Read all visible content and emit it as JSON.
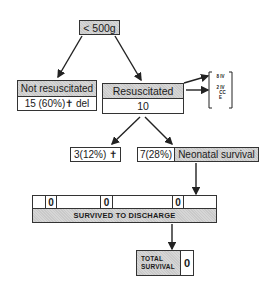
{
  "root": {
    "label": "< 500g"
  },
  "not_resuscitated": {
    "title": "Not resuscitated",
    "value": "15 (60%)✝ del"
  },
  "resuscitated": {
    "title": "Resuscitated",
    "value": "10",
    "methods": [
      "8 IV",
      "2 IV",
      "CC",
      "E"
    ]
  },
  "outcomes": {
    "died": "3(12%) ✝",
    "survived_count": "7(28%)",
    "survived_label": "Neonatal survival"
  },
  "discharge": {
    "cells": [
      "",
      "0",
      "",
      "0",
      "",
      "0",
      ""
    ],
    "label": "SURVIVED TO DISCHARGE"
  },
  "total": {
    "label_line1": "TOTAL",
    "label_line2": "SURVIVAL",
    "value": "0"
  },
  "colors": {
    "line": "#333333",
    "shade": "#d6d6d6"
  }
}
